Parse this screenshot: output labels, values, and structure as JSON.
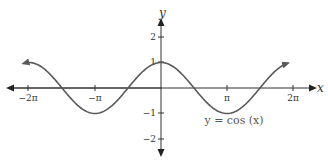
{
  "chart_data": {
    "type": "line",
    "title": "",
    "function": "cos(x)",
    "xlabel": "x",
    "ylabel": "y",
    "xlim": [
      -6.6,
      6.8
    ],
    "ylim": [
      -2.4,
      2.5
    ],
    "grid": false,
    "legend": "none",
    "x_ticks": [
      {
        "value": -6.2832,
        "label": "−2π"
      },
      {
        "value": -3.1416,
        "label": "−π"
      },
      {
        "value": 3.1416,
        "label": "π"
      },
      {
        "value": 6.2832,
        "label": "2π"
      }
    ],
    "y_ticks": [
      {
        "value": 2,
        "label": "2"
      },
      {
        "value": 1,
        "label": "1"
      },
      {
        "value": -1,
        "label": "−1"
      },
      {
        "value": -2,
        "label": "−2"
      }
    ],
    "series": [
      {
        "name": "y = cos (x)",
        "x_range": [
          -6.55,
          6.05
        ],
        "points": [
          [
            -6.2832,
            1
          ],
          [
            -4.7124,
            0
          ],
          [
            -3.1416,
            -1
          ],
          [
            -1.5708,
            0
          ],
          [
            0,
            1
          ],
          [
            1.5708,
            0
          ],
          [
            3.1416,
            -1
          ],
          [
            4.7124,
            0
          ],
          [
            6.2832,
            1
          ]
        ],
        "color": "#595959"
      }
    ],
    "annotations": [
      {
        "text": "y = cos (x)",
        "x": 3.1416,
        "y": -1.6
      }
    ]
  },
  "labels": {
    "x_axis": "x",
    "y_axis": "y",
    "equation": "y = cos (x)",
    "xt0": "−2π",
    "xt1": "−π",
    "xt2": "π",
    "xt3": "2π",
    "yt0": "2",
    "yt1": "1",
    "yt2": "−1",
    "yt3": "−2"
  },
  "colors": {
    "axis": "#333333",
    "curve": "#595959",
    "background": "#ffffff"
  }
}
